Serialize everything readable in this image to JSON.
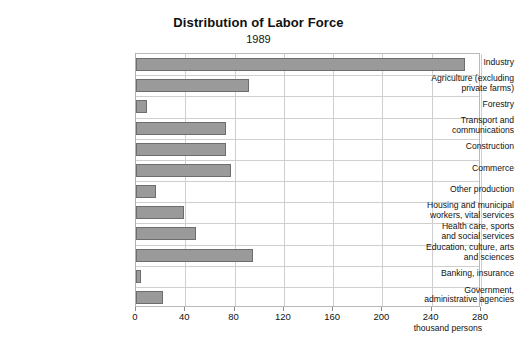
{
  "chart_data": {
    "type": "bar",
    "orientation": "horizontal",
    "title": "Distribution of Labor Force",
    "subtitle": "1989",
    "xlabel": "thousand persons",
    "ylabel": "",
    "xlim": [
      0,
      280
    ],
    "xticks": [
      0,
      40,
      80,
      120,
      160,
      200,
      240,
      280
    ],
    "xtick_labels": [
      "0",
      "40",
      "80",
      "120",
      "160",
      "200",
      "240",
      "280"
    ],
    "grid": true,
    "legend": "none",
    "bar_color": "#9a9a9a",
    "bar_edge_color": "#6d6d6d",
    "categories": [
      "Industry",
      "Agriculture (excluding\nprivate farms)",
      "Forestry",
      "Transport and\ncommunications",
      "Construction",
      "Commerce",
      "Other production",
      "Housing and municipal\nworkers, vital services",
      "Health  care, sports\nand social services",
      "Education, culture, arts\nand sciences",
      "Banking, insurance",
      "Government,\nadministrative agencies"
    ],
    "values": [
      267,
      92,
      9,
      73,
      73,
      77,
      16,
      39,
      49,
      95,
      4,
      22
    ],
    "units": "thousand persons"
  }
}
